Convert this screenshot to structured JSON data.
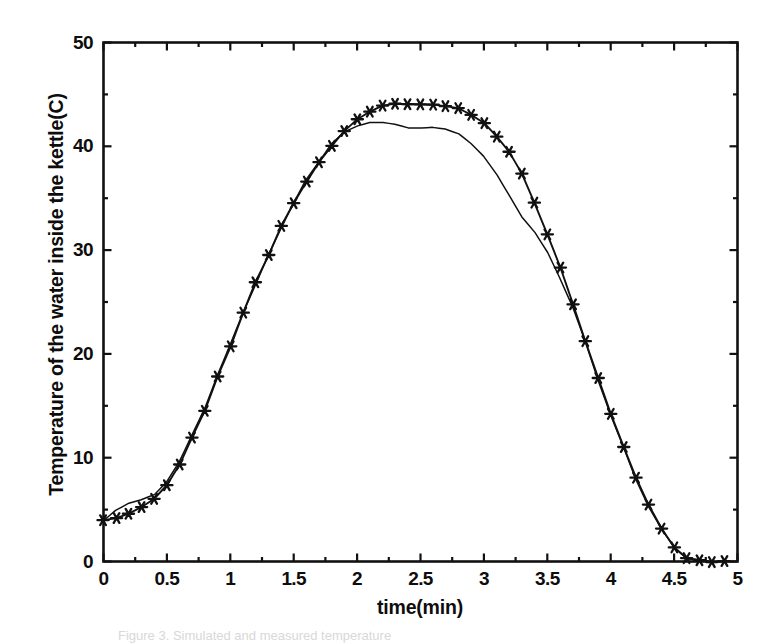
{
  "figure": {
    "background_color": "#ffffff",
    "ink_color": "#111111",
    "caption": "Figure 3. Simulated and measured temperature"
  },
  "chart_data": {
    "type": "line",
    "title": "",
    "subtitle": "",
    "xlabel": "time(min)",
    "ylabel": "Temperature of the water inside the kettle(C)",
    "xlim": [
      0,
      5
    ],
    "ylim": [
      0,
      50
    ],
    "grid": false,
    "legend": "none",
    "frame": "box",
    "xticks": [
      0,
      0.5,
      1,
      1.5,
      2,
      2.5,
      3,
      3.5,
      4,
      4.5,
      5
    ],
    "xtick_labels": [
      "0",
      "0.5",
      "1",
      "1.5",
      "2",
      "2.5",
      "3",
      "3.5",
      "4",
      "4.5",
      "5"
    ],
    "yticks": [
      0,
      10,
      20,
      30,
      40,
      50
    ],
    "ytick_labels": [
      "0",
      "10",
      "20",
      "30",
      "40",
      "50"
    ],
    "x_minor_tick_interval": 0.25,
    "y_minor_tick_interval": 5,
    "series": [
      {
        "name": "measured",
        "marker": "star",
        "line_style": "solid",
        "color": "#111111",
        "x": [
          0.0,
          0.1,
          0.2,
          0.3,
          0.4,
          0.5,
          0.6,
          0.7,
          0.8,
          0.9,
          1.0,
          1.1,
          1.2,
          1.3,
          1.4,
          1.5,
          1.6,
          1.7,
          1.8,
          1.9,
          2.0,
          2.1,
          2.2,
          2.3,
          2.4,
          2.5,
          2.6,
          2.7,
          2.8,
          2.9,
          3.0,
          3.1,
          3.2,
          3.3,
          3.4,
          3.5,
          3.6,
          3.7,
          3.8,
          3.9,
          4.0,
          4.1,
          4.2,
          4.3,
          4.4,
          4.5,
          4.6,
          4.7,
          4.8,
          4.9
        ],
        "values": [
          4.0,
          4.2,
          4.6,
          5.2,
          6.0,
          7.3,
          9.4,
          12.0,
          14.6,
          17.8,
          20.8,
          24.0,
          26.9,
          29.6,
          32.4,
          34.5,
          36.6,
          38.4,
          40.0,
          41.4,
          42.6,
          43.4,
          43.9,
          44.1,
          44.1,
          44.0,
          44.0,
          43.9,
          43.6,
          43.1,
          42.2,
          41.0,
          39.4,
          37.3,
          34.6,
          31.6,
          28.3,
          24.8,
          21.2,
          17.6,
          14.2,
          11.0,
          8.0,
          5.4,
          3.2,
          1.4,
          0.3,
          0.1,
          0.0,
          0.0
        ]
      },
      {
        "name": "simulated",
        "marker": "none",
        "line_style": "solid",
        "color": "#111111",
        "x": [
          0.0,
          0.1,
          0.2,
          0.3,
          0.4,
          0.5,
          0.6,
          0.7,
          0.8,
          0.9,
          1.0,
          1.1,
          1.2,
          1.3,
          1.4,
          1.5,
          1.6,
          1.7,
          1.8,
          1.9,
          2.0,
          2.1,
          2.2,
          2.3,
          2.4,
          2.5,
          2.6,
          2.7,
          2.8,
          2.9,
          3.0,
          3.1,
          3.2,
          3.3,
          3.4,
          3.5,
          3.6,
          3.7,
          3.8,
          3.9,
          4.0,
          4.1,
          4.2,
          4.3,
          4.4,
          4.5,
          4.6,
          4.7,
          4.8,
          4.9
        ],
        "values": [
          4.0,
          4.8,
          5.5,
          6.0,
          6.6,
          7.6,
          9.6,
          12.2,
          14.8,
          17.9,
          20.9,
          23.9,
          26.7,
          29.5,
          32.2,
          34.4,
          36.7,
          38.6,
          40.2,
          41.4,
          42.1,
          42.4,
          42.3,
          42.0,
          41.8,
          41.8,
          41.8,
          41.7,
          41.3,
          40.4,
          39.0,
          37.2,
          35.2,
          33.3,
          31.6,
          29.9,
          27.4,
          24.4,
          21.0,
          17.5,
          14.1,
          10.9,
          7.9,
          5.3,
          3.1,
          1.3,
          0.3,
          0.1,
          0.0,
          0.0
        ]
      }
    ]
  }
}
